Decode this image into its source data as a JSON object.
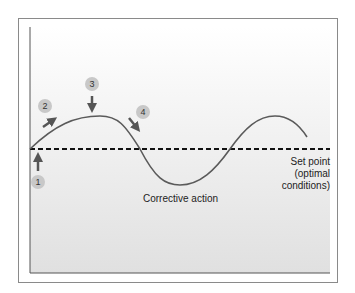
{
  "diagram": {
    "labels": {
      "set_point_line1": "Set point",
      "set_point_line2": "(optimal",
      "set_point_line3": "conditions)",
      "corrective_action": "Corrective action"
    },
    "steps": [
      {
        "number": "1",
        "arrow": "up"
      },
      {
        "number": "2",
        "arrow": "up-right"
      },
      {
        "number": "3",
        "arrow": "down"
      },
      {
        "number": "4",
        "arrow": "down-right"
      }
    ],
    "colors": {
      "curve": "#5a5a5a",
      "setpoint_line": "#111111",
      "badge": "#c8c8c8",
      "arrow": "#555555",
      "background_top": "#ffffff",
      "background_bottom": "#e2e2e2"
    }
  }
}
